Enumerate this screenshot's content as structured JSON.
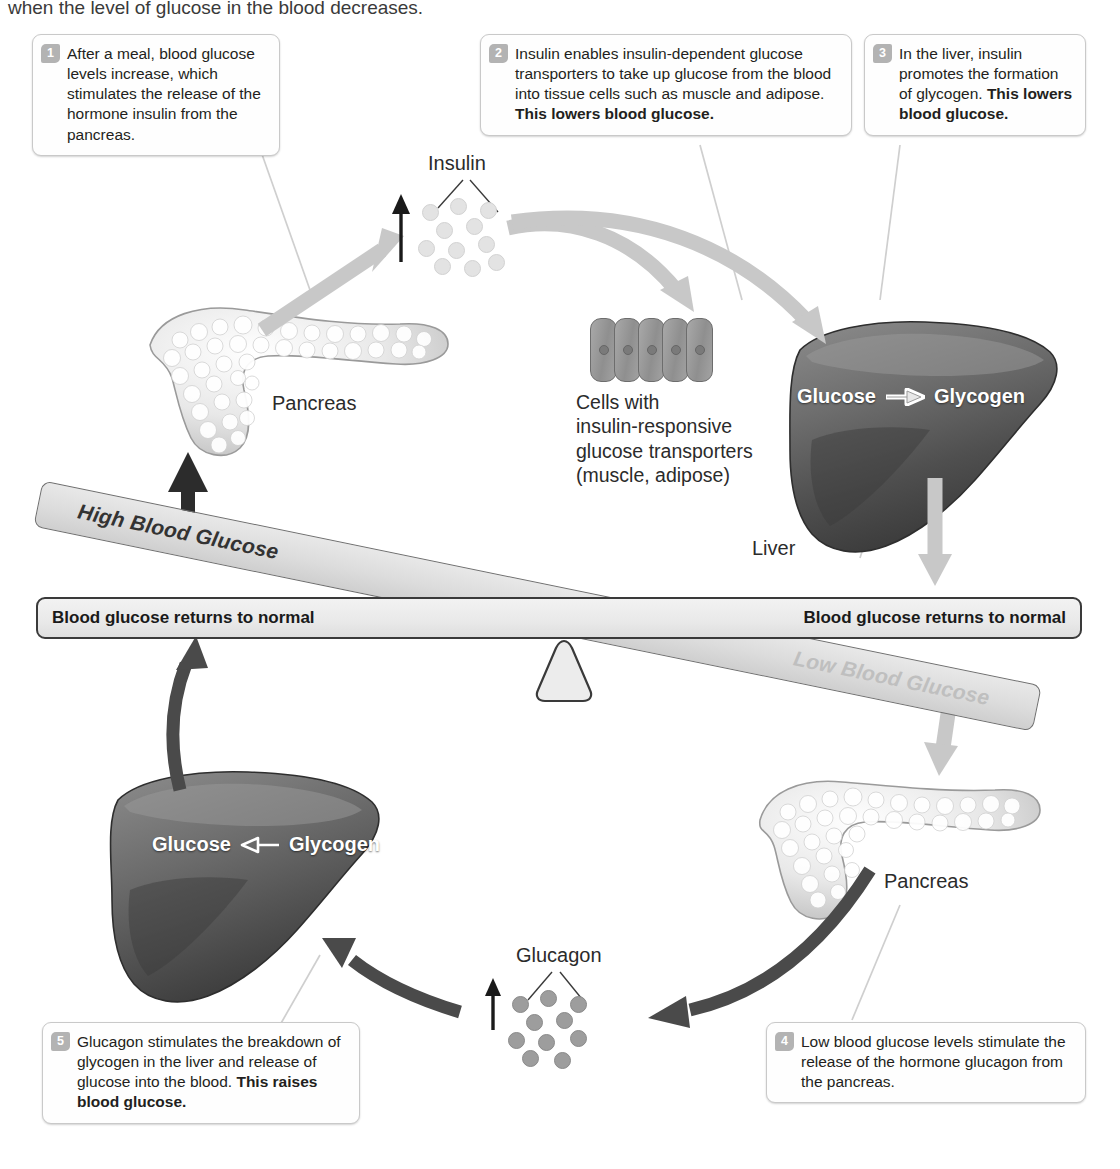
{
  "figure": {
    "cut_off_heading": "when the level of glucose in the blood decreases."
  },
  "steps": [
    {
      "number": "1",
      "text": "After a meal, blood glucose levels increase, which stimulates the release of the hormone insulin from the pancreas.",
      "bold_text": ""
    },
    {
      "number": "2",
      "text": "Insulin enables insulin-dependent glucose transporters to take up glucose from the blood into tissue cells such as muscle and adipose. ",
      "bold_text": "This lowers blood glucose."
    },
    {
      "number": "3",
      "text": "In the liver, insulin promotes the formation of glycogen. ",
      "bold_text": "This lowers blood glucose."
    },
    {
      "number": "4",
      "text": "Low blood glucose levels stimulate the release of the hormone glucagon from the pancreas.",
      "bold_text": ""
    },
    {
      "number": "5",
      "text": "Glucagon stimulates the breakdown of glycogen in the liver and release of glucose into the blood. ",
      "bold_text": "This raises blood glucose."
    }
  ],
  "balance": {
    "tilted_beam_left_label": "High Blood Glucose",
    "tilted_beam_right_label": "Low Blood Glucose",
    "flat_beam_left_label": "Blood glucose returns to normal",
    "flat_beam_right_label": "Blood glucose returns to normal"
  },
  "labels": {
    "insulin": "Insulin",
    "glucagon": "Glucagon",
    "pancreas_top": "Pancreas",
    "pancreas_bottom": "Pancreas",
    "liver": "Liver",
    "cells_line1": "Cells with",
    "cells_line2": "insulin-responsive",
    "cells_line3": "glucose transporters",
    "cells_line4": "(muscle, adipose)"
  },
  "liver_top": {
    "left_term": "Glucose",
    "arrow": "right-arrow",
    "right_term": "Glycogen"
  },
  "liver_bottom": {
    "left_term": "Glucose",
    "arrow": "left-arrow",
    "right_term": "Glycogen"
  },
  "colors": {
    "beam_fill": "#e4e4e4",
    "beam_stroke": "#6f6f6f",
    "flat_beam_stroke": "#3a3a3a",
    "light_arrow": "#c8c8c8",
    "dark_arrow": "#4a4a4a",
    "number_badge": "#b3b3b3",
    "insulin_dot": "#e3e3e3",
    "glucagon_dot": "#9d9d9d",
    "text": "#231f20"
  }
}
